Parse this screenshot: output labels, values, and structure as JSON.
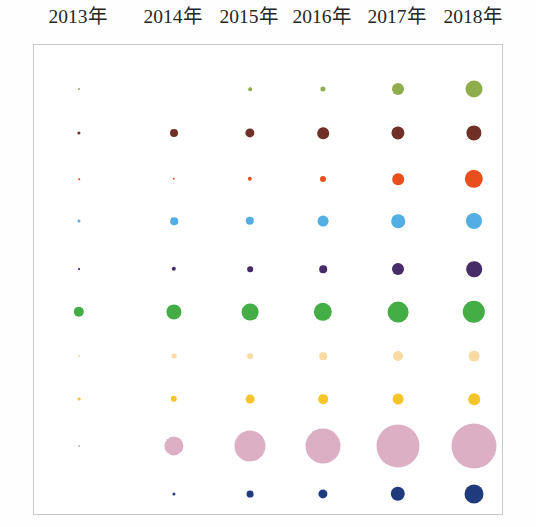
{
  "chart_data": {
    "type": "scatter",
    "title": "",
    "subtitle": "",
    "xlabel": "",
    "ylabel": "",
    "grid": false,
    "legend": "none",
    "note": "Bubble matrix: bubble area encodes magnitude; one color per category row, one column per year.",
    "categories": [
      "2013年",
      "2014年",
      "2015年",
      "2016年",
      "2017年",
      "2018年"
    ],
    "column_labels": [
      "2013年",
      "2014年",
      "2015年",
      "2016年",
      "2017年",
      "2018年"
    ],
    "column_x": [
      78,
      173,
      249,
      322,
      397,
      473
    ],
    "row_y": [
      88,
      132,
      178,
      220,
      268,
      311,
      355,
      398,
      445,
      493
    ],
    "series": [
      {
        "name": "series-1",
        "color": "#8fae4b",
        "values": [
          0.4,
          0.0,
          1.2,
          2.6,
          7.0,
          10.5
        ],
        "radii": [
          1.0,
          0.0,
          1.8,
          2.6,
          6.0,
          8.5
        ]
      },
      {
        "name": "series-2",
        "color": "#703028",
        "values": [
          1.0,
          4.2,
          5.0,
          7.0,
          8.0,
          9.0
        ],
        "radii": [
          1.6,
          4.0,
          4.6,
          5.8,
          6.6,
          7.6
        ]
      },
      {
        "name": "series-3",
        "color": "#ea4d1e",
        "values": [
          0.2,
          0.5,
          1.6,
          2.4,
          6.0,
          11.0
        ],
        "radii": [
          0.8,
          1.2,
          2.2,
          3.0,
          5.8,
          9.2
        ]
      },
      {
        "name": "series-4",
        "color": "#52aee3",
        "values": [
          1.0,
          4.0,
          4.4,
          6.0,
          8.0,
          9.5
        ],
        "radii": [
          1.6,
          3.8,
          4.2,
          5.4,
          6.8,
          8.0
        ]
      },
      {
        "name": "series-5",
        "color": "#472a68",
        "values": [
          0.3,
          1.6,
          2.2,
          3.4,
          6.2,
          9.0
        ],
        "radii": [
          0.9,
          2.2,
          2.8,
          3.8,
          6.0,
          7.8
        ]
      },
      {
        "name": "series-6",
        "color": "#44ad45",
        "values": [
          6.0,
          9.0,
          10.0,
          11.0,
          12.5,
          13.5
        ],
        "radii": [
          5.2,
          7.6,
          8.4,
          9.2,
          10.4,
          11.2
        ]
      },
      {
        "name": "series-7",
        "color": "#f9daa2",
        "values": [
          0.4,
          1.6,
          2.0,
          3.2,
          4.6,
          5.2
        ],
        "radii": [
          1.0,
          2.4,
          2.8,
          3.8,
          5.0,
          5.4
        ]
      },
      {
        "name": "series-8",
        "color": "#f6c52c",
        "values": [
          0.8,
          2.4,
          4.0,
          4.6,
          5.2,
          5.6
        ],
        "radii": [
          1.4,
          3.2,
          4.4,
          4.8,
          5.4,
          5.8
        ]
      },
      {
        "name": "series-9",
        "color": "#dcafc4",
        "values": [
          0.3,
          11.0,
          17.5,
          20.0,
          24.0,
          25.5
        ],
        "radii": [
          0.9,
          9.6,
          15.5,
          17.5,
          21.5,
          22.5
        ]
      },
      {
        "name": "series-10",
        "color": "#1f3a7d",
        "values": [
          0.0,
          1.2,
          3.2,
          4.6,
          7.6,
          10.5
        ],
        "radii": [
          0.0,
          1.6,
          3.4,
          4.6,
          7.2,
          9.5
        ]
      }
    ]
  },
  "figure": {
    "background_color": "#ffffff",
    "panel_border_color": "#c9c9c9",
    "label_color": "#262626"
  }
}
